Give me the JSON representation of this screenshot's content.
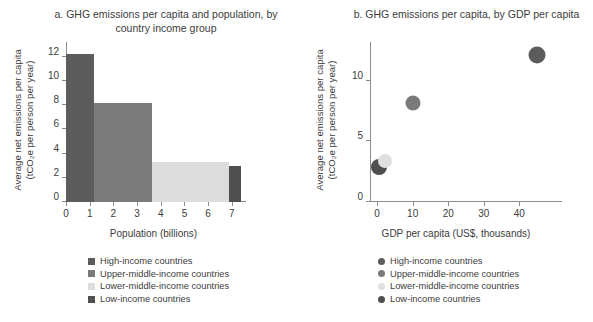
{
  "chart_data": [
    {
      "type": "bar",
      "id": "panel-a",
      "title": "a. GHG emissions per capita and population,",
      "title_line2": "by country income group",
      "xlabel": "Population (billions)",
      "ylabel_line1": "Average net emissions per capita",
      "ylabel_line2": "(tCO₂e per person per year)",
      "xlim": [
        0,
        7.6
      ],
      "ylim": [
        0,
        13.2
      ],
      "xticks": [
        0,
        1,
        2,
        3,
        4,
        5,
        6,
        7
      ],
      "yticks": [
        0,
        2,
        4,
        6,
        8,
        10,
        12
      ],
      "grid": false,
      "note": "variable-width bars: width = population, height = emissions per capita",
      "categories": [
        "High-income countries",
        "Upper-middle-income countries",
        "Lower-middle-income countries",
        "Low-income countries"
      ],
      "values": [
        12.2,
        8.2,
        3.3,
        2.95
      ],
      "widths": [
        1.2,
        2.45,
        3.25,
        0.5
      ],
      "x_starts": [
        0,
        1.2,
        3.65,
        6.9
      ],
      "colors": [
        "#5c5c5c",
        "#7a7a7a",
        "#dcdcdc",
        "#4f4f4f"
      ]
    },
    {
      "type": "scatter",
      "id": "panel-b",
      "title": "b. GHG emissions per capita,",
      "title_line2": "by GDP per capita",
      "xlabel": "GDP per capita (US$, thousands)",
      "ylabel_line1": "Average net emissions per capita",
      "ylabel_line2": "(tCO₂e per person per year)",
      "xlim": [
        -2,
        52
      ],
      "ylim": [
        0,
        13.2
      ],
      "xticks": [
        0,
        10,
        20,
        30,
        40
      ],
      "yticks": [
        0,
        5,
        10
      ],
      "grid": false,
      "legend_position": "bottom",
      "points": [
        {
          "label": "High-income countries",
          "x": 45.0,
          "y": 12.1,
          "color": "#5c5c5c",
          "size": 17
        },
        {
          "label": "Upper-middle-income countries",
          "x": 10.0,
          "y": 8.2,
          "color": "#7a7a7a",
          "size": 15
        },
        {
          "label": "Lower-middle-income countries",
          "x": 2.2,
          "y": 3.35,
          "color": "#e0e0e0",
          "size": 14
        },
        {
          "label": "Low-income countries",
          "x": 0.6,
          "y": 2.9,
          "color": "#4f4f4f",
          "size": 16
        }
      ]
    }
  ],
  "legend_a": {
    "items": [
      {
        "label": "High-income countries",
        "color": "#5c5c5c"
      },
      {
        "label": "Upper-middle-income countries",
        "color": "#7a7a7a"
      },
      {
        "label": "Lower-middle-income countries",
        "color": "#dcdcdc"
      },
      {
        "label": "Low-income countries",
        "color": "#4f4f4f"
      }
    ]
  },
  "legend_b": {
    "items": [
      {
        "label": "High-income countries",
        "color": "#5c5c5c"
      },
      {
        "label": "Upper-middle-income countries",
        "color": "#7a7a7a"
      },
      {
        "label": "Lower-middle-income countries",
        "color": "#e0e0e0"
      },
      {
        "label": "Low-income countries",
        "color": "#4f4f4f"
      }
    ]
  }
}
